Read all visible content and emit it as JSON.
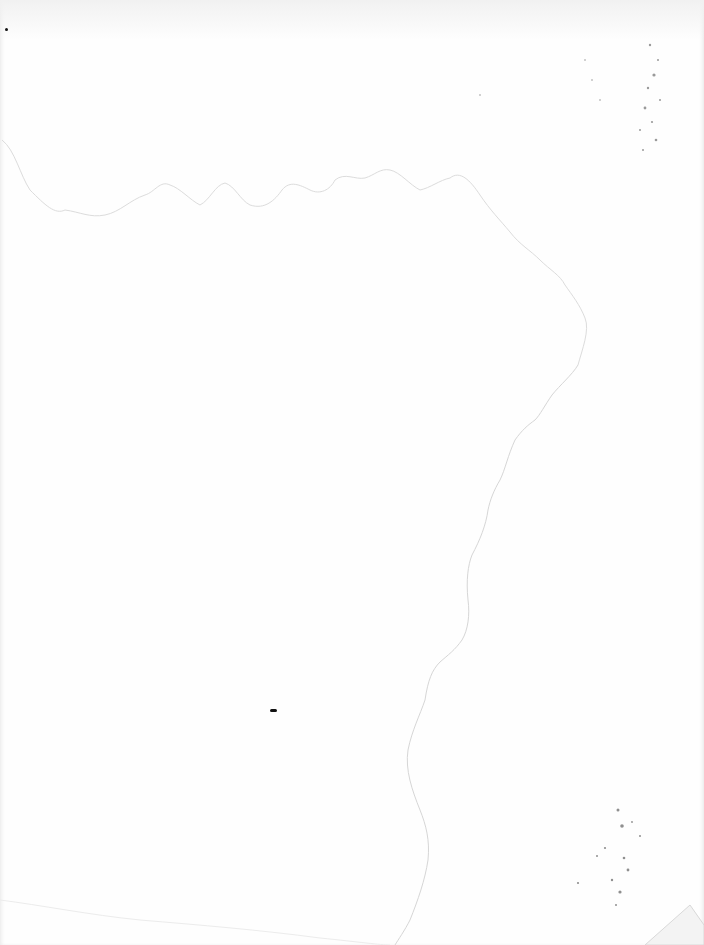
{
  "document": {
    "type": "blank scanned page",
    "text": "",
    "colors": {
      "paper": "#fefefe",
      "stain_edge": "#d9d9d9",
      "speckle": "#8a8a8a",
      "mark": "#111111"
    }
  }
}
